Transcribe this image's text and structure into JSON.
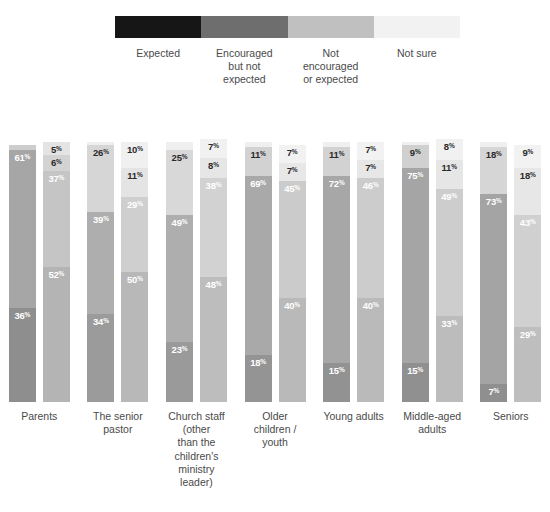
{
  "legend": {
    "items": [
      {
        "label": "Expected",
        "color": "#161616"
      },
      {
        "label": "Encouraged\nbut not\nexpected",
        "color": "#6e6e6e"
      },
      {
        "label": "Not\nencouraged\nor expected",
        "color": "#c0c0c0"
      },
      {
        "label": "Not sure",
        "color": "#f2f2f2"
      }
    ]
  },
  "chart_data": {
    "type": "bar",
    "title": "",
    "xlabel": "",
    "ylabel": "",
    "ylim": [
      0,
      100
    ],
    "stacked": true,
    "orientation": "vertical",
    "grid": false,
    "legend_position": "top",
    "value_suffix": "%",
    "series": [
      {
        "name": "Expected",
        "color": "#8d8d8d"
      },
      {
        "name": "Encouraged but not expected",
        "color": "#a8a8a8"
      },
      {
        "name": "Not encouraged or expected",
        "color": "#c6c6c6"
      },
      {
        "name": "Not sure",
        "color": "#ebebeb"
      }
    ],
    "categories": [
      "Parents",
      "The senior\npastor",
      "Church staff\n(other\nthan the\nchildren's\nministry\nleader)",
      "Older\nchildren /\nyouth",
      "Young adults",
      "Middle-aged\nadults",
      "Seniors"
    ],
    "groups": [
      {
        "category": "Parents",
        "bars": [
          {
            "segments": [
              {
                "series": "Expected",
                "value": 36,
                "label": "36",
                "shade": "#8e8e8e",
                "label_color": "on-dark",
                "label_pos": "inside"
              },
              {
                "series": "Encouraged but not expected",
                "value": 61,
                "label": "61",
                "shade": "#a6a6a6",
                "label_color": "on-dark",
                "label_pos": "inside"
              },
              {
                "series": "Not encouraged or expected",
                "value": 2,
                "label": "2",
                "shade": "#cdcdcd",
                "label_color": "on-light",
                "label_pos": "above"
              },
              {
                "series": "Not sure",
                "value": 0,
                "label": "0",
                "shade": "#efefef",
                "label_color": "on-light",
                "label_pos": "above2"
              }
            ]
          },
          {
            "segments": [
              {
                "series": "Expected",
                "value": 52,
                "label": "52",
                "shade": "#b4b4b4",
                "label_color": "on-dark",
                "label_pos": "inside"
              },
              {
                "series": "Encouraged but not expected",
                "value": 37,
                "label": "37",
                "shade": "#c5c5c5",
                "label_color": "on-dark",
                "label_pos": "inside"
              },
              {
                "series": "Not encouraged or expected",
                "value": 6,
                "label": "6",
                "shade": "#d3d3d3",
                "label_color": "on-light",
                "label_pos": "inside"
              },
              {
                "series": "Not sure",
                "value": 5,
                "label": "5",
                "shade": "#e4e4e4",
                "label_color": "on-light",
                "label_pos": "inside"
              }
            ]
          }
        ]
      },
      {
        "category": "The senior pastor",
        "bars": [
          {
            "segments": [
              {
                "series": "Expected",
                "value": 34,
                "label": "34",
                "shade": "#9b9b9b",
                "label_color": "on-dark",
                "label_pos": "inside"
              },
              {
                "series": "Encouraged but not expected",
                "value": 39,
                "label": "39",
                "shade": "#aeaeae",
                "label_color": "on-dark",
                "label_pos": "inside"
              },
              {
                "series": "Not encouraged or expected",
                "value": 26,
                "label": "26",
                "shade": "#d6d6d6",
                "label_color": "on-light",
                "label_pos": "inside"
              },
              {
                "series": "Not sure",
                "value": 1,
                "label": "1",
                "shade": "#efefef",
                "label_color": "on-light",
                "label_pos": "above"
              }
            ]
          },
          {
            "segments": [
              {
                "series": "Expected",
                "value": 50,
                "label": "50",
                "shade": "#b8b8b8",
                "label_color": "on-dark",
                "label_pos": "inside"
              },
              {
                "series": "Encouraged but not expected",
                "value": 29,
                "label": "29",
                "shade": "#cfcfcf",
                "label_color": "on-dark",
                "label_pos": "inside"
              },
              {
                "series": "Not encouraged or expected",
                "value": 11,
                "label": "11",
                "shade": "#e4e4e4",
                "label_color": "on-light",
                "label_pos": "inside"
              },
              {
                "series": "Not sure",
                "value": 10,
                "label": "10",
                "shade": "#f0f0f0",
                "label_color": "on-light",
                "label_pos": "inside"
              }
            ]
          }
        ]
      },
      {
        "category": "Church staff (other than the children's ministry leader)",
        "bars": [
          {
            "segments": [
              {
                "series": "Expected",
                "value": 23,
                "label": "23",
                "shade": "#9a9a9a",
                "label_color": "on-dark",
                "label_pos": "inside"
              },
              {
                "series": "Encouraged but not expected",
                "value": 49,
                "label": "49",
                "shade": "#aeaeae",
                "label_color": "on-dark",
                "label_pos": "inside"
              },
              {
                "series": "Not encouraged or expected",
                "value": 25,
                "label": "25",
                "shade": "#d8d8d8",
                "label_color": "on-light",
                "label_pos": "inside"
              },
              {
                "series": "Not sure",
                "value": 3,
                "label": "3",
                "shade": "#efefef",
                "label_color": "on-light",
                "label_pos": "above"
              }
            ]
          },
          {
            "segments": [
              {
                "series": "Expected",
                "value": 48,
                "label": "48",
                "shade": "#bdbdbd",
                "label_color": "on-dark",
                "label_pos": "inside"
              },
              {
                "series": "Encouraged but not expected",
                "value": 38,
                "label": "38",
                "shade": "#d2d2d2",
                "label_color": "on-dark",
                "label_pos": "inside"
              },
              {
                "series": "Not encouraged or expected",
                "value": 8,
                "label": "8",
                "shade": "#e6e6e6",
                "label_color": "on-light",
                "label_pos": "inside"
              },
              {
                "series": "Not sure",
                "value": 7,
                "label": "7",
                "shade": "#f1f1f1",
                "label_color": "on-light",
                "label_pos": "inside"
              }
            ]
          }
        ]
      },
      {
        "category": "Older children / youth",
        "bars": [
          {
            "segments": [
              {
                "series": "Expected",
                "value": 18,
                "label": "18",
                "shade": "#949494",
                "label_color": "on-dark",
                "label_pos": "inside"
              },
              {
                "series": "Encouraged but not expected",
                "value": 69,
                "label": "69",
                "shade": "#a9a9a9",
                "label_color": "on-dark",
                "label_pos": "inside"
              },
              {
                "series": "Not encouraged or expected",
                "value": 11,
                "label": "11",
                "shade": "#d2d2d2",
                "label_color": "on-light",
                "label_pos": "inside"
              },
              {
                "series": "Not sure",
                "value": 2,
                "label": "2",
                "shade": "#efefef",
                "label_color": "on-light",
                "label_pos": "above"
              }
            ]
          },
          {
            "segments": [
              {
                "series": "Expected",
                "value": 40,
                "label": "40",
                "shade": "#b9b9b9",
                "label_color": "on-dark",
                "label_pos": "inside"
              },
              {
                "series": "Encouraged but not expected",
                "value": 45,
                "label": "45",
                "shade": "#cbcbcb",
                "label_color": "on-dark",
                "label_pos": "inside"
              },
              {
                "series": "Not encouraged or expected",
                "value": 7,
                "label": "7",
                "shade": "#e7e7e7",
                "label_color": "on-light",
                "label_pos": "inside"
              },
              {
                "series": "Not sure",
                "value": 7,
                "label": "7",
                "shade": "#f2f2f2",
                "label_color": "on-light",
                "label_pos": "inside"
              }
            ]
          }
        ]
      },
      {
        "category": "Young adults",
        "bars": [
          {
            "segments": [
              {
                "series": "Expected",
                "value": 15,
                "label": "15",
                "shade": "#929292",
                "label_color": "on-dark",
                "label_pos": "inside"
              },
              {
                "series": "Encouraged but not expected",
                "value": 72,
                "label": "72",
                "shade": "#a7a7a7",
                "label_color": "on-dark",
                "label_pos": "inside"
              },
              {
                "series": "Not encouraged or expected",
                "value": 11,
                "label": "11",
                "shade": "#d2d2d2",
                "label_color": "on-light",
                "label_pos": "inside"
              },
              {
                "series": "Not sure",
                "value": 2,
                "label": "2",
                "shade": "#efefef",
                "label_color": "on-light",
                "label_pos": "above"
              }
            ]
          },
          {
            "segments": [
              {
                "series": "Expected",
                "value": 40,
                "label": "40",
                "shade": "#bababa",
                "label_color": "on-dark",
                "label_pos": "inside"
              },
              {
                "series": "Encouraged but not expected",
                "value": 46,
                "label": "46",
                "shade": "#cccccc",
                "label_color": "on-dark",
                "label_pos": "inside"
              },
              {
                "series": "Not encouraged or expected",
                "value": 7,
                "label": "7",
                "shade": "#e7e7e7",
                "label_color": "on-light",
                "label_pos": "inside"
              },
              {
                "series": "Not sure",
                "value": 7,
                "label": "7",
                "shade": "#f2f2f2",
                "label_color": "on-light",
                "label_pos": "inside"
              }
            ]
          }
        ]
      },
      {
        "category": "Middle-aged adults",
        "bars": [
          {
            "segments": [
              {
                "series": "Expected",
                "value": 15,
                "label": "15",
                "shade": "#909090",
                "label_color": "on-dark",
                "label_pos": "inside"
              },
              {
                "series": "Encouraged but not expected",
                "value": 75,
                "label": "75",
                "shade": "#a5a5a5",
                "label_color": "on-dark",
                "label_pos": "inside"
              },
              {
                "series": "Not encouraged or expected",
                "value": 9,
                "label": "9",
                "shade": "#d0d0d0",
                "label_color": "on-light",
                "label_pos": "inside"
              },
              {
                "series": "Not sure",
                "value": 1,
                "label": "1",
                "shade": "#efefef",
                "label_color": "on-light",
                "label_pos": "above"
              }
            ]
          },
          {
            "segments": [
              {
                "series": "Expected",
                "value": 33,
                "label": "33",
                "shade": "#bcbcbc",
                "label_color": "on-dark",
                "label_pos": "inside"
              },
              {
                "series": "Encouraged but not expected",
                "value": 49,
                "label": "49",
                "shade": "#cdcdcd",
                "label_color": "on-dark",
                "label_pos": "inside"
              },
              {
                "series": "Not encouraged or expected",
                "value": 11,
                "label": "11",
                "shade": "#e6e6e6",
                "label_color": "on-light",
                "label_pos": "inside"
              },
              {
                "series": "Not sure",
                "value": 8,
                "label": "8",
                "shade": "#f1f1f1",
                "label_color": "on-light",
                "label_pos": "inside"
              }
            ]
          }
        ]
      },
      {
        "category": "Seniors",
        "bars": [
          {
            "segments": [
              {
                "series": "Expected",
                "value": 7,
                "label": "7",
                "shade": "#8f8f8f",
                "label_color": "on-dark",
                "label_pos": "inside"
              },
              {
                "series": "Encouraged but not expected",
                "value": 73,
                "label": "73",
                "shade": "#a4a4a4",
                "label_color": "on-dark",
                "label_pos": "inside"
              },
              {
                "series": "Not encouraged or expected",
                "value": 18,
                "label": "18",
                "shade": "#d6d6d6",
                "label_color": "on-light",
                "label_pos": "inside"
              },
              {
                "series": "Not sure",
                "value": 2,
                "label": "2",
                "shade": "#efefef",
                "label_color": "on-light",
                "label_pos": "above"
              }
            ]
          },
          {
            "segments": [
              {
                "series": "Expected",
                "value": 29,
                "label": "29",
                "shade": "#bebebe",
                "label_color": "on-dark",
                "label_pos": "inside"
              },
              {
                "series": "Encouraged but not expected",
                "value": 43,
                "label": "43",
                "shade": "#d0d0d0",
                "label_color": "on-dark",
                "label_pos": "inside"
              },
              {
                "series": "Not encouraged or expected",
                "value": 18,
                "label": "18",
                "shade": "#e7e7e7",
                "label_color": "on-light",
                "label_pos": "inside"
              },
              {
                "series": "Not sure",
                "value": 9,
                "label": "9",
                "shade": "#f2f2f2",
                "label_color": "on-light",
                "label_pos": "inside"
              }
            ]
          }
        ]
      }
    ]
  }
}
